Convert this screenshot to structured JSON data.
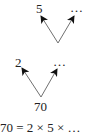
{
  "diagram": {
    "type": "factor-tree",
    "top_tree": {
      "left_child": "5",
      "right_child": "…"
    },
    "bottom_tree": {
      "left_child": "2",
      "right_child": "…",
      "root": "70"
    },
    "equation": "70 = 2 × 5 × …"
  },
  "colors": {
    "line": "#707070",
    "arrowhead": "#111111",
    "text": "#222222"
  }
}
